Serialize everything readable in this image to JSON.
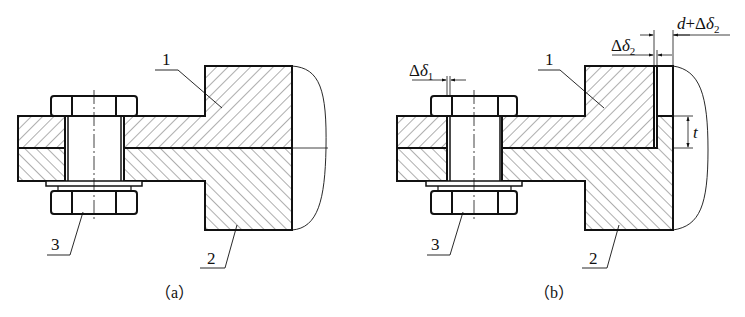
{
  "figure": {
    "panels": [
      {
        "id": "a",
        "caption": "（a）",
        "parts": [
          {
            "label": "1",
            "desc": "upper part"
          },
          {
            "label": "2",
            "desc": "lower part"
          },
          {
            "label": "3",
            "desc": "bolt"
          }
        ]
      },
      {
        "id": "b",
        "caption": "（b）",
        "parts": [
          {
            "label": "1",
            "desc": "upper part"
          },
          {
            "label": "2",
            "desc": "lower part"
          },
          {
            "label": "3",
            "desc": "bolt"
          }
        ],
        "dimensions": {
          "delta1": {
            "base": "Δ",
            "sym": "δ",
            "sub": "1"
          },
          "delta2": {
            "base": "Δ",
            "sym": "δ",
            "sub": "2"
          },
          "d_plus_delta2": {
            "pre": "d",
            "op": "+Δ",
            "sym": "δ",
            "sub": "2"
          },
          "t": "t"
        }
      }
    ]
  },
  "colors": {
    "line": "#111111",
    "hatch": "#333333",
    "background": "#ffffff"
  }
}
